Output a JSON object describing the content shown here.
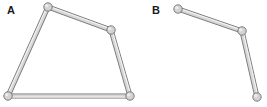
{
  "figure": {
    "background_color": "#ffffff",
    "width": 267,
    "height": 107
  },
  "style": {
    "bar_fill": "#d6d6d6",
    "bar_stroke": "#7d7d7d",
    "bar_highlight": "#f2f2f2",
    "bar_thickness": 4.2,
    "bar_stroke_width": 0.9,
    "joint_fill": "#d3d3d3",
    "joint_stroke": "#6f6f6f",
    "joint_stroke_width": 0.9,
    "joint_radius": 4.2,
    "label_color": "#1b1b1b",
    "label_font_size": 11
  },
  "panels": [
    {
      "id": "panel-a",
      "label": "A",
      "label_x": 7,
      "label_y": 14,
      "linkage_type": "closed four-bar quadrilateral",
      "joints": [
        {
          "id": "a1",
          "name": "top-left-joint",
          "x": 48,
          "y": 7
        },
        {
          "id": "a2",
          "name": "right-middle-joint",
          "x": 111,
          "y": 30
        },
        {
          "id": "a3",
          "name": "bottom-right-joint",
          "x": 130,
          "y": 96
        },
        {
          "id": "a4",
          "name": "bottom-left-joint",
          "x": 8,
          "y": 96
        }
      ],
      "links": [
        {
          "id": "a-link-top",
          "name": "link-top",
          "from": "a1",
          "to": "a2"
        },
        {
          "id": "a-link-right",
          "name": "link-right",
          "from": "a2",
          "to": "a3"
        },
        {
          "id": "a-link-bottom",
          "name": "link-bottom",
          "from": "a3",
          "to": "a4"
        },
        {
          "id": "a-link-left",
          "name": "link-left",
          "from": "a4",
          "to": "a1"
        }
      ]
    },
    {
      "id": "panel-b",
      "label": "B",
      "label_x": 152,
      "label_y": 14,
      "linkage_type": "open two-link chain",
      "joints": [
        {
          "id": "b1",
          "name": "upper-left-joint",
          "x": 178,
          "y": 9
        },
        {
          "id": "b2",
          "name": "middle-joint",
          "x": 242,
          "y": 31
        },
        {
          "id": "b3",
          "name": "lower-right-joint",
          "x": 257,
          "y": 97
        }
      ],
      "links": [
        {
          "id": "b-link-upper",
          "name": "link-upper",
          "from": "b1",
          "to": "b2"
        },
        {
          "id": "b-link-lower",
          "name": "link-lower",
          "from": "b2",
          "to": "b3"
        }
      ]
    }
  ]
}
